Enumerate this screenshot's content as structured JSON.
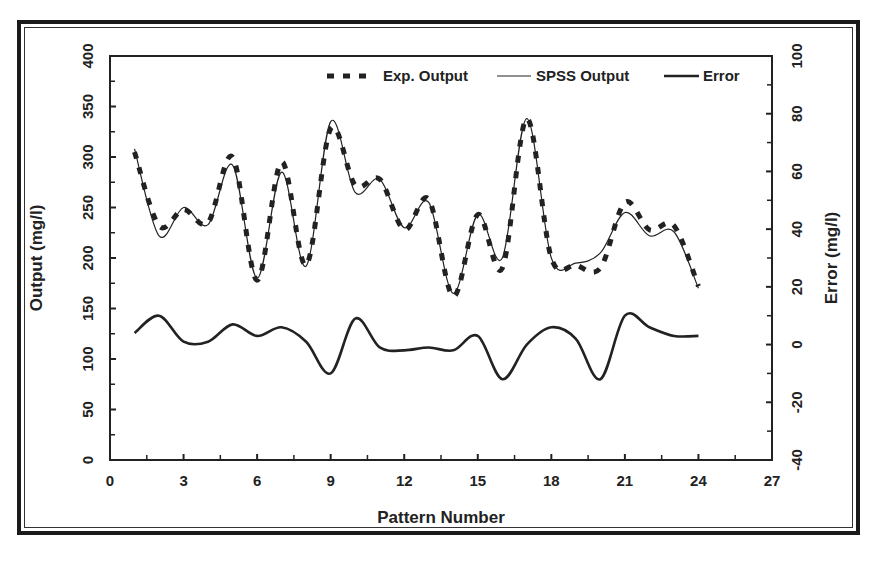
{
  "chart_data": {
    "type": "line",
    "title": "",
    "xlabel": "Pattern Number",
    "ylabel": "Output (mg/l)",
    "y2label": "Error (mg/l)",
    "xlim": [
      0,
      27
    ],
    "ylim": [
      0,
      400
    ],
    "y2lim": [
      -40,
      100
    ],
    "xticks": [
      0,
      3,
      6,
      9,
      12,
      15,
      18,
      21,
      24,
      27
    ],
    "yticks": [
      0,
      50,
      100,
      150,
      200,
      250,
      300,
      350,
      400
    ],
    "y2ticks": [
      -40,
      -20,
      0,
      20,
      40,
      60,
      80,
      100
    ],
    "grid": false,
    "legend_position": "top-right inside",
    "x": [
      1,
      2,
      3,
      4,
      5,
      6,
      7,
      8,
      9,
      10,
      11,
      12,
      13,
      14,
      15,
      16,
      17,
      18,
      19,
      20,
      21,
      22,
      23,
      24
    ],
    "series": [
      {
        "name": "Exp. Output",
        "axis": "left",
        "style": "dashed-thick",
        "values": [
          305,
          232,
          248,
          235,
          300,
          178,
          295,
          193,
          328,
          272,
          278,
          228,
          258,
          162,
          243,
          190,
          338,
          200,
          193,
          190,
          255,
          228,
          232,
          172
        ]
      },
      {
        "name": "SPSS Output",
        "axis": "left",
        "style": "thin-solid",
        "values": [
          308,
          222,
          250,
          233,
          292,
          180,
          285,
          192,
          335,
          265,
          278,
          230,
          255,
          165,
          243,
          200,
          338,
          200,
          195,
          205,
          245,
          222,
          226,
          170
        ]
      },
      {
        "name": "Error",
        "axis": "right",
        "style": "thick-solid",
        "values": [
          4,
          10,
          1,
          1,
          7,
          3,
          6,
          1,
          -10,
          9,
          -1,
          -2,
          -1,
          -2,
          3,
          -12,
          0,
          6,
          2,
          -12,
          10,
          6,
          3,
          3
        ]
      }
    ]
  },
  "labels": {
    "xlabel": "Pattern Number",
    "ylabel": "Output (mg/l)",
    "y2label": "Error (mg/l)",
    "legend": [
      "Exp. Output",
      "SPSS Output",
      "Error"
    ]
  },
  "colors": {
    "line": "#222222",
    "frame": "#1a1a1a",
    "background": "#ffffff"
  }
}
